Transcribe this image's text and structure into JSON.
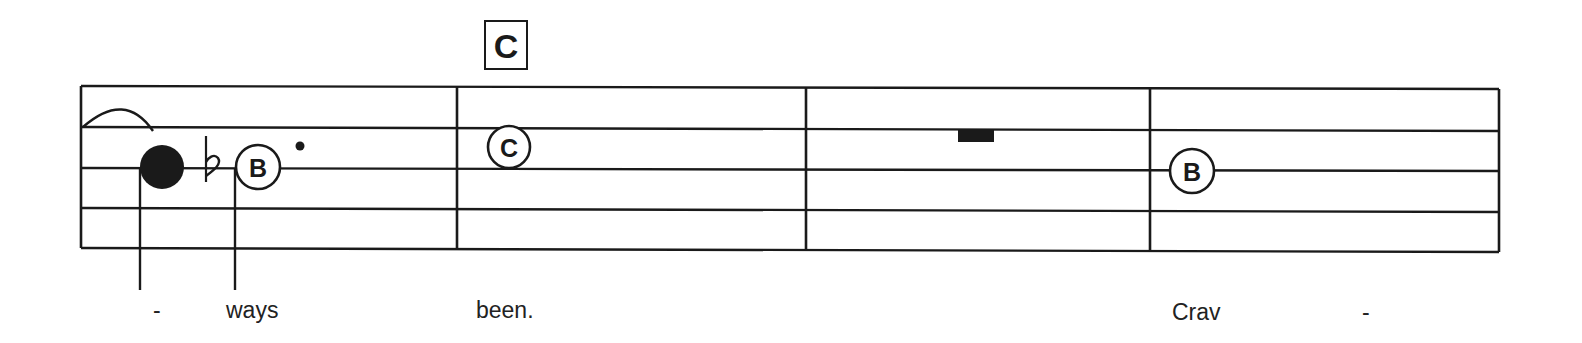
{
  "rehearsal_mark": {
    "label": "C"
  },
  "staff": {
    "lines": 5,
    "measures": 4
  },
  "measures": [
    {
      "index": 1,
      "elements": [
        {
          "type": "slur-end"
        },
        {
          "type": "filled-note"
        },
        {
          "type": "flat"
        },
        {
          "type": "note",
          "letter": "B"
        },
        {
          "type": "dot"
        }
      ],
      "lyrics": [
        "-",
        "ways"
      ]
    },
    {
      "index": 2,
      "elements": [
        {
          "type": "note",
          "letter": "C"
        }
      ],
      "lyrics": [
        "been."
      ]
    },
    {
      "index": 3,
      "elements": [
        {
          "type": "whole-rest"
        }
      ],
      "lyrics": []
    },
    {
      "index": 4,
      "elements": [
        {
          "type": "note",
          "letter": "B"
        }
      ],
      "lyrics": [
        "Crav",
        "-"
      ]
    }
  ],
  "notes": {
    "m1_b": "B",
    "m2_c": "C",
    "m4_b": "B"
  },
  "lyrics": {
    "m1_hyphen": "-",
    "m1_word": "ways",
    "m2_word": "been.",
    "m4_word": "Crav",
    "m4_hyphen": "-"
  },
  "colors": {
    "ink": "#1a1a1a",
    "paper": "#ffffff"
  }
}
